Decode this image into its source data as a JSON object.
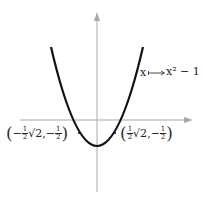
{
  "diagram": {
    "function_label": {
      "var": "x",
      "maps_to": "x² − 1"
    },
    "points": [
      {
        "name": "left-point",
        "paren_open": "(",
        "sign": "−",
        "frac_num": "1",
        "frac_den": "2",
        "root": "√2",
        "sep": ",",
        "sign2": "−",
        "frac2_num": "1",
        "frac2_den": "2",
        "paren_close": ")"
      },
      {
        "name": "right-point",
        "paren_open": "(",
        "frac_num": "1",
        "frac_den": "2",
        "root": "√2",
        "sep": ",",
        "sign2": "−",
        "frac2_num": "1",
        "frac2_den": "2",
        "paren_close": ")"
      }
    ],
    "colors": {
      "axis": "#a8a8a8",
      "curve": "#111111",
      "text": "#222222"
    }
  }
}
